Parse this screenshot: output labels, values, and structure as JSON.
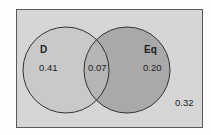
{
  "diagram": {
    "type": "venn",
    "sets": [
      {
        "name": "D",
        "only_value": "0.41",
        "fill": "#c9c9c9"
      },
      {
        "name": "Eq",
        "only_value": "0.20",
        "fill": "#a9a9a9"
      }
    ],
    "intersection": {
      "sets": [
        "D",
        "Eq"
      ],
      "value": "0.07",
      "fill": "#b5b5b5"
    },
    "outside": {
      "value": "0.32",
      "fill": "#d6d6d6"
    },
    "colors": {
      "border": "#5a5a5a",
      "circle_stroke": "#333333",
      "text": "#222222"
    }
  }
}
